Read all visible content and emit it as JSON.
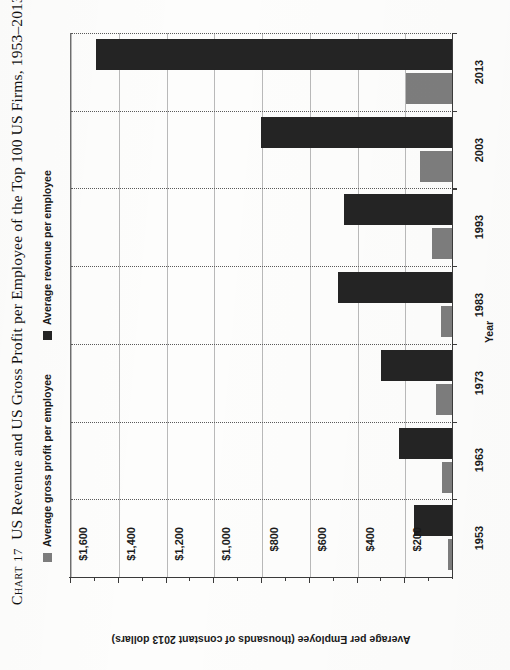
{
  "caption": {
    "chart_word": "Chart",
    "chart_number": "17",
    "text": "US Revenue and US Gross Profit per Employee of the Top 100 US Firms, 1953–2013"
  },
  "legend": {
    "entries": [
      {
        "label": "Average gross profit per employee",
        "color": "#7d7d7d",
        "swatch_name": "legend-swatch-gross-profit"
      },
      {
        "label": "Average revenue per employee",
        "color": "#242424",
        "swatch_name": "legend-swatch-revenue"
      }
    ]
  },
  "axes": {
    "value_axis_title": "Average per Employee (thousands of constant 2013 dollars)",
    "value_ticks": [
      "$1,600",
      "$1,400",
      "$1,200",
      "$1,000",
      "$800",
      "$600",
      "$400",
      "$200"
    ],
    "category_axis_title": "Year",
    "category_ticks": [
      "2013",
      "2003",
      "1993",
      "1983",
      "1973",
      "1963",
      "1953"
    ]
  },
  "chart_data": {
    "type": "bar",
    "orientation": "horizontal",
    "title": "US Revenue and US Gross Profit per Employee of the Top 100 US Firms, 1953–2013",
    "xlabel": "Year",
    "ylabel": "Average per Employee (thousands of constant 2013 dollars)",
    "categories": [
      "1953",
      "1963",
      "1973",
      "1983",
      "1993",
      "2003",
      "2013"
    ],
    "ylim": [
      0,
      1600
    ],
    "tick_interval": 200,
    "grid": true,
    "legend_position": "top-left",
    "series": [
      {
        "name": "Average revenue per employee",
        "color": "#242424",
        "values": [
          163,
          226,
          302,
          482,
          456,
          805,
          1495
        ]
      },
      {
        "name": "Average gross profit per employee",
        "color": "#7d7d7d",
        "values": [
          21,
          46,
          71,
          50,
          88,
          138,
          197
        ]
      }
    ]
  }
}
